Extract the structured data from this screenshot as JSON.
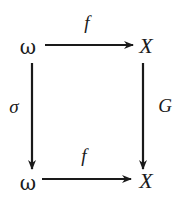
{
  "diagram": {
    "type": "commutative-square",
    "nodes": {
      "top_left": "ω",
      "top_right": "X",
      "bottom_left": "ω",
      "bottom_right": "X"
    },
    "arrows": {
      "top": {
        "label": "f",
        "from": "top_left",
        "to": "top_right"
      },
      "left": {
        "label": "σ",
        "from": "top_left",
        "to": "bottom_left"
      },
      "right": {
        "label": "G",
        "from": "top_right",
        "to": "bottom_right"
      },
      "bottom": {
        "label": "f",
        "from": "bottom_left",
        "to": "bottom_right"
      }
    },
    "colors": {
      "ink": "#1a1a1a",
      "background": "#ffffff"
    }
  }
}
